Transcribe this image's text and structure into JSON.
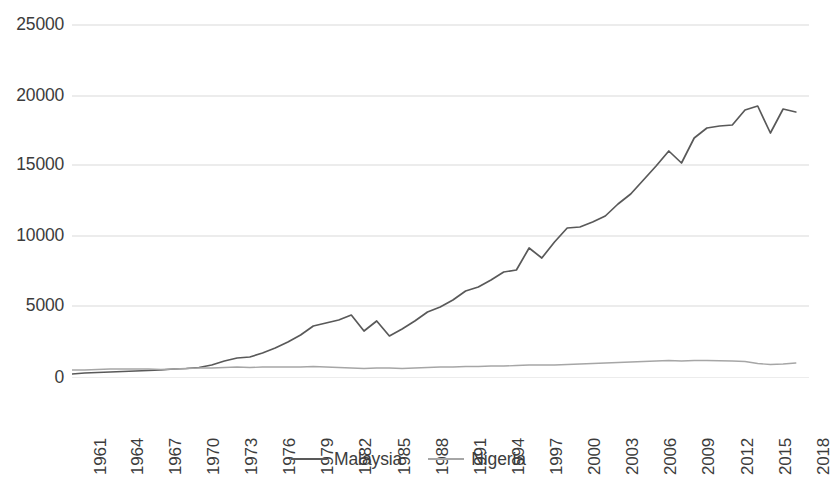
{
  "chart_data": {
    "type": "line",
    "title": "",
    "subtitle": "",
    "xlabel": "",
    "ylabel": "",
    "xlim": [
      1961,
      2018
    ],
    "ylim": [
      0,
      25000
    ],
    "grid": true,
    "grid_axis": "y",
    "legend_position": "bottom",
    "y_ticks": [
      0,
      5000,
      10000,
      15000,
      20000,
      25000
    ],
    "y_tick_labels": [
      "0",
      "5000",
      "10000",
      "15000",
      "20000",
      "25000"
    ],
    "x_tick_labels": [
      "1961",
      "1964",
      "1967",
      "1970",
      "1973",
      "1976",
      "1979",
      "1982",
      "1985",
      "1988",
      "1991",
      "1994",
      "1997",
      "2000",
      "2003",
      "2006",
      "2009",
      "2012",
      "2015",
      "2018"
    ],
    "x_tick_rotation": 90,
    "x": [
      1961,
      1962,
      1963,
      1964,
      1965,
      1966,
      1967,
      1968,
      1969,
      1970,
      1971,
      1972,
      1973,
      1974,
      1975,
      1976,
      1977,
      1978,
      1979,
      1980,
      1981,
      1982,
      1983,
      1984,
      1985,
      1986,
      1987,
      1988,
      1989,
      1990,
      1991,
      1992,
      1993,
      1994,
      1995,
      1996,
      1997,
      1998,
      1999,
      2000,
      2001,
      2002,
      2003,
      2004,
      2005,
      2006,
      2007,
      2008,
      2009,
      2010,
      2011,
      2012,
      2013,
      2014,
      2015,
      2016,
      2017,
      2018
    ],
    "series": [
      {
        "name": "Malaysia",
        "color": "#595959",
        "values": [
          280,
          290,
          300,
          310,
          320,
          340,
          350,
          360,
          390,
          410,
          430,
          470,
          690,
          800,
          780,
          920,
          1020,
          1200,
          1430,
          1810,
          1860,
          1880,
          1990,
          2220,
          2080,
          1760,
          1950,
          2100,
          2300,
          2600,
          2900,
          3200,
          3450,
          3800,
          4400,
          4800,
          4700,
          3300,
          3600,
          4000,
          3900,
          4100,
          4400,
          4900,
          5500,
          6000,
          7100,
          8500,
          7200,
          9000,
          10400,
          10800,
          10900,
          11300,
          9700,
          9800,
          10100,
          11200
        ]
      },
      {
        "name": "Nigeria",
        "color": "#a6a6a6",
        "values": [
          570,
          550,
          580,
          600,
          610,
          580,
          480,
          450,
          540,
          640,
          700,
          710,
          760,
          930,
          920,
          990,
          1030,
          1050,
          1080,
          1140,
          1030,
          920,
          830,
          700,
          730,
          720,
          420,
          330,
          280,
          320,
          300,
          310,
          270,
          290,
          280,
          320,
          360,
          350,
          330,
          380,
          390,
          450,
          540,
          650,
          800,
          940,
          1090,
          1220,
          1100,
          1260,
          1350,
          1420,
          1500,
          1550,
          1400,
          1120,
          1070,
          1130
        ]
      }
    ],
    "series_display": [
      {
        "name": "Malaysia",
        "color": "#595959",
        "points_px": [
          [
            0,
            366
          ],
          [
            12.7,
            365
          ],
          [
            25.4,
            364.5
          ],
          [
            38.1,
            364
          ],
          [
            50.8,
            363.5
          ],
          [
            63.5,
            363
          ],
          [
            76.2,
            362.5
          ],
          [
            88.9,
            362
          ],
          [
            101.6,
            361
          ],
          [
            114.3,
            360.5
          ],
          [
            127,
            359.5
          ],
          [
            139.7,
            357
          ],
          [
            152.4,
            353
          ],
          [
            165.1,
            350
          ],
          [
            177.8,
            349
          ],
          [
            190.5,
            345
          ],
          [
            203.2,
            340
          ],
          [
            215.9,
            334
          ],
          [
            228.6,
            327
          ],
          [
            241.3,
            318
          ],
          [
            254,
            315
          ],
          [
            266.7,
            312
          ],
          [
            279.3,
            307
          ],
          [
            292,
            323
          ],
          [
            304.7,
            313
          ],
          [
            317.4,
            328
          ],
          [
            330.1,
            321
          ],
          [
            342.8,
            313
          ],
          [
            355.5,
            304
          ],
          [
            368.2,
            299
          ],
          [
            380.9,
            292
          ],
          [
            393.6,
            283
          ],
          [
            406.3,
            279
          ],
          [
            419,
            272
          ],
          [
            431.7,
            264
          ],
          [
            444.4,
            262
          ],
          [
            457.1,
            240
          ],
          [
            469.8,
            250
          ],
          [
            482.5,
            234
          ],
          [
            495.2,
            220
          ],
          [
            507.9,
            219
          ],
          [
            520.6,
            214
          ],
          [
            533.3,
            208
          ],
          [
            546,
            196
          ],
          [
            558.7,
            186
          ],
          [
            571.4,
            172
          ],
          [
            584.1,
            158
          ],
          [
            596.8,
            143
          ],
          [
            609.5,
            155
          ],
          [
            622.2,
            130
          ],
          [
            634.9,
            120
          ],
          [
            647.6,
            118
          ],
          [
            660.3,
            117
          ],
          [
            673,
            102
          ],
          [
            685.7,
            98
          ],
          [
            698.4,
            125
          ],
          [
            711.1,
            101
          ],
          [
            723.8,
            104
          ]
        ]
      },
      {
        "name": "Nigeria",
        "color": "#a6a6a6",
        "points_px": [
          [
            0,
            362
          ],
          [
            12.7,
            362
          ],
          [
            25.4,
            361.5
          ],
          [
            38.1,
            361
          ],
          [
            50.8,
            361
          ],
          [
            63.5,
            361
          ],
          [
            76.2,
            361
          ],
          [
            88.9,
            361.5
          ],
          [
            101.6,
            361
          ],
          [
            114.3,
            360.5
          ],
          [
            127,
            360
          ],
          [
            139.7,
            360
          ],
          [
            152.4,
            359.5
          ],
          [
            165.1,
            359
          ],
          [
            177.8,
            359.5
          ],
          [
            190.5,
            359
          ],
          [
            203.2,
            359
          ],
          [
            215.9,
            359
          ],
          [
            228.6,
            359
          ],
          [
            241.3,
            358.5
          ],
          [
            254,
            359
          ],
          [
            266.7,
            359.5
          ],
          [
            279.3,
            360
          ],
          [
            292,
            360.5
          ],
          [
            304.7,
            360
          ],
          [
            317.4,
            360
          ],
          [
            330.1,
            360.5
          ],
          [
            342.8,
            360
          ],
          [
            355.5,
            359.5
          ],
          [
            368.2,
            359
          ],
          [
            380.9,
            359
          ],
          [
            393.6,
            358.5
          ],
          [
            406.3,
            358.5
          ],
          [
            419,
            358
          ],
          [
            431.7,
            358
          ],
          [
            444.4,
            357.5
          ],
          [
            457.1,
            357
          ],
          [
            469.8,
            357
          ],
          [
            482.5,
            357
          ],
          [
            495.2,
            356.5
          ],
          [
            507.9,
            356
          ],
          [
            520.6,
            355.5
          ],
          [
            533.3,
            355
          ],
          [
            546,
            354.5
          ],
          [
            558.7,
            354
          ],
          [
            571.4,
            353.5
          ],
          [
            584.1,
            353
          ],
          [
            596.8,
            352.5
          ],
          [
            609.5,
            353
          ],
          [
            622.2,
            352.5
          ],
          [
            634.9,
            352.5
          ],
          [
            647.6,
            352.8
          ],
          [
            660.3,
            353
          ],
          [
            673,
            353.5
          ],
          [
            685.7,
            355.5
          ],
          [
            698.4,
            356.5
          ],
          [
            711.1,
            356
          ],
          [
            723.8,
            355
          ]
        ]
      }
    ]
  },
  "axes": {
    "y_tick_positions_px": [
      370,
      298,
      228,
      157,
      88,
      17
    ],
    "x_tick_positions_px": [
      8,
      45,
      83,
      121,
      159,
      197,
      235,
      273,
      312,
      350,
      388,
      426,
      464,
      502,
      540,
      578,
      616,
      655,
      693,
      731
    ]
  },
  "legend": {
    "entries": [
      {
        "label": "Malaysia",
        "color": "#595959"
      },
      {
        "label": "Nigeria",
        "color": "#a6a6a6"
      }
    ]
  },
  "style": {
    "background": "#ffffff",
    "text_color": "#3c3c3c",
    "gridline_color": "#d9d9d9",
    "malaysia_color": "#595959",
    "nigeria_color": "#a6a6a6"
  }
}
